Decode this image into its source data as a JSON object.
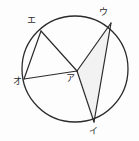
{
  "figure": {
    "kind": "circle-geometry-diagram",
    "background_color": "#fdfdfd",
    "stroke_color": "#2b2b2b",
    "shade_color": "#f2f2f2",
    "circle": {
      "cx": 75,
      "cy": 69,
      "r": 53,
      "stroke_width": 1.3
    },
    "points": [
      {
        "id": "a",
        "label": "ア",
        "x": 77,
        "y": 71,
        "label_x": 66,
        "label_y": 74,
        "role": "interior-vertex"
      },
      {
        "id": "i",
        "label": "イ",
        "x": 94,
        "y": 122,
        "label_x": 89,
        "label_y": 127,
        "role": "on-circle"
      },
      {
        "id": "u",
        "label": "ウ",
        "x": 111,
        "y": 23,
        "label_x": 99,
        "label_y": 8,
        "role": "on-circle"
      },
      {
        "id": "e",
        "label": "エ",
        "x": 41,
        "y": 31,
        "label_x": 27,
        "label_y": 16,
        "role": "on-circle"
      },
      {
        "id": "o",
        "label": "オ",
        "x": 24,
        "y": 79,
        "label_x": 13,
        "label_y": 77,
        "role": "on-circle"
      }
    ],
    "segments": [
      {
        "name": "segment-e-o",
        "from": "e",
        "to": "o"
      },
      {
        "name": "segment-e-a",
        "from": "e",
        "to": "a"
      },
      {
        "name": "segment-o-a",
        "from": "o",
        "to": "a"
      },
      {
        "name": "segment-a-u",
        "from": "a",
        "to": "u"
      },
      {
        "name": "segment-a-i",
        "from": "a",
        "to": "i"
      },
      {
        "name": "segment-u-i",
        "from": "u",
        "to": "i"
      }
    ],
    "shaded_regions": [
      {
        "name": "triangle-a-u-i",
        "vertices": [
          "a",
          "u",
          "i"
        ]
      }
    ]
  }
}
